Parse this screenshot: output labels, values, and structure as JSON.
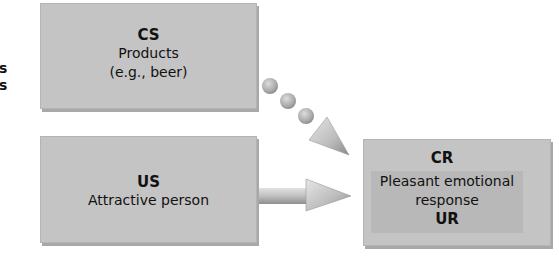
{
  "left_fragments": [
    "s",
    "s"
  ],
  "cs_box": {
    "title": "CS",
    "lines": [
      "Products",
      "(e.g., beer)"
    ]
  },
  "us_box": {
    "title": "US",
    "lines": [
      "Attractive person"
    ]
  },
  "cr_box": {
    "top_title": "CR",
    "lines": [
      "Pleasant emotional",
      "response"
    ],
    "bottom_title": "UR"
  },
  "colors": {
    "box": "#c4c4c4",
    "inner_box": "#b8b8b8",
    "arrow": "#bcbcbc",
    "dot": "#b0b0b0",
    "text": "#111111"
  }
}
